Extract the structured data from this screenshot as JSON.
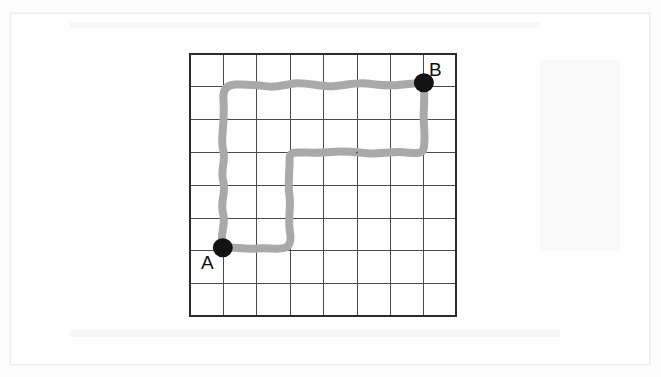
{
  "document": {
    "type": "grid-path-diagram",
    "background_color": "#fdfdfd"
  },
  "figure": {
    "grid": {
      "columns": 8,
      "rows": 8,
      "line_color": "#4a4a4a",
      "border_color": "#2b2b2b",
      "cell_width": 33.4,
      "cell_height": 32.8,
      "origin_x": 1,
      "origin_y": 1,
      "width": 267,
      "height": 262
    },
    "path": {
      "color": "#a9a9a9",
      "stroke_width": 8,
      "style": "hand-drawn-wavy",
      "description": "Staircase route from A to B along grid lines",
      "waypoints": [
        {
          "col": 1,
          "row": 6,
          "name": "A"
        },
        {
          "col": 1,
          "row": 1
        },
        {
          "col": 7,
          "row": 1
        },
        {
          "col": 7,
          "row": 3
        },
        {
          "col": 3,
          "row": 3
        },
        {
          "col": 3,
          "row": 6
        },
        {
          "col": 1,
          "row": 6,
          "name": "A"
        }
      ],
      "total_length_cells": 22
    },
    "points": [
      {
        "id": "A",
        "label": "A",
        "col": 1,
        "row": 6,
        "marker_color": "#121212",
        "marker_radius_x": 10,
        "marker_radius_y": 9.5,
        "label_position": "below-left"
      },
      {
        "id": "B",
        "label": "B",
        "col": 7,
        "row": 1,
        "marker_color": "#121212",
        "marker_radius_x": 10,
        "marker_radius_y": 9.5,
        "label_position": "above-right"
      }
    ]
  }
}
